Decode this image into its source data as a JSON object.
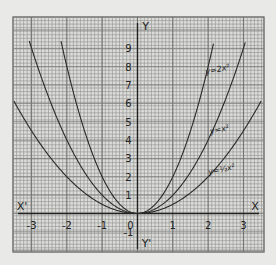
{
  "chart_data": {
    "type": "line",
    "title": "",
    "xlabel": "X",
    "xlabel_neg": "X'",
    "ylabel": "Y",
    "ylabel_neg": "Y'",
    "xlim": [
      -3.5,
      3.5
    ],
    "ylim": [
      -2,
      10.5
    ],
    "grid": true,
    "x_ticks": [
      -3,
      -2,
      -1,
      0,
      1,
      2,
      3
    ],
    "x_tick_labels": [
      "-3",
      "-2",
      "-1",
      "0",
      "1",
      "2",
      "3"
    ],
    "y_ticks": [
      -1,
      1,
      2,
      3,
      4,
      5,
      6,
      7,
      8,
      9
    ],
    "y_tick_labels": [
      "-1",
      "1",
      "2",
      "3",
      "4",
      "5",
      "6",
      "7",
      "8",
      "9"
    ],
    "series": [
      {
        "name": "y=2x²",
        "label": "y=2x²",
        "coef": 2,
        "x": [
          -2.1,
          -2,
          -1.5,
          -1,
          -0.5,
          0,
          0.5,
          1,
          1.5,
          2,
          2.1
        ],
        "values": [
          8.82,
          8,
          4.5,
          2,
          0.5,
          0,
          0.5,
          2,
          4.5,
          8,
          8.82
        ]
      },
      {
        "name": "y=x²",
        "label": "y=x²",
        "coef": 1,
        "x": [
          -3,
          -2.5,
          -2,
          -1.5,
          -1,
          -0.5,
          0,
          0.5,
          1,
          1.5,
          2,
          2.5,
          3
        ],
        "values": [
          9,
          6.25,
          4,
          2.25,
          1,
          0.25,
          0,
          0.25,
          1,
          2.25,
          4,
          6.25,
          9
        ]
      },
      {
        "name": "y=½x²",
        "label": "y=½x²",
        "coef": 0.5,
        "x": [
          -3.2,
          -3,
          -2,
          -1,
          0,
          1,
          2,
          3,
          3.3
        ],
        "values": [
          5.12,
          4.5,
          2,
          0.5,
          0,
          0.5,
          2,
          4.5,
          5.45
        ]
      }
    ]
  }
}
